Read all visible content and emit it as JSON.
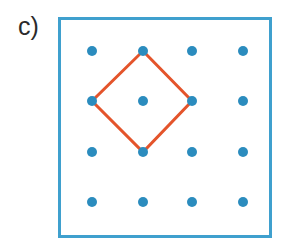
{
  "figure": {
    "panel_label": "c)",
    "label_color": "#2b2b2b",
    "background_color": "#ffffff",
    "width": 290,
    "height": 248
  },
  "board": {
    "name": "geoboard",
    "frame_color": "#3fa0ce",
    "frame_stroke_width": 3,
    "frame_fill": "#ffffff",
    "x": 58,
    "y": 17,
    "width": 214,
    "height": 221
  },
  "grid": {
    "rows": 4,
    "cols": 4,
    "dot_color": "#2b8cbe",
    "dot_radius": 5,
    "x_positions": [
      92,
      143,
      192,
      243
    ],
    "y_positions": [
      51,
      101,
      152,
      202
    ],
    "points": [
      {
        "row": 0,
        "col": 0,
        "cx": 92,
        "cy": 51
      },
      {
        "row": 0,
        "col": 1,
        "cx": 143,
        "cy": 51
      },
      {
        "row": 0,
        "col": 2,
        "cx": 192,
        "cy": 51
      },
      {
        "row": 0,
        "col": 3,
        "cx": 243,
        "cy": 51
      },
      {
        "row": 1,
        "col": 0,
        "cx": 92,
        "cy": 101
      },
      {
        "row": 1,
        "col": 1,
        "cx": 143,
        "cy": 101
      },
      {
        "row": 1,
        "col": 2,
        "cx": 192,
        "cy": 101
      },
      {
        "row": 1,
        "col": 3,
        "cx": 243,
        "cy": 101
      },
      {
        "row": 2,
        "col": 0,
        "cx": 92,
        "cy": 152
      },
      {
        "row": 2,
        "col": 1,
        "cx": 143,
        "cy": 152
      },
      {
        "row": 2,
        "col": 2,
        "cx": 192,
        "cy": 152
      },
      {
        "row": 2,
        "col": 3,
        "cx": 243,
        "cy": 152
      },
      {
        "row": 3,
        "col": 0,
        "cx": 92,
        "cy": 202
      },
      {
        "row": 3,
        "col": 1,
        "cx": 143,
        "cy": 202
      },
      {
        "row": 3,
        "col": 2,
        "cx": 192,
        "cy": 202
      },
      {
        "row": 3,
        "col": 3,
        "cx": 243,
        "cy": 202
      }
    ]
  },
  "shape": {
    "name": "rubber-band-square-rotated",
    "stroke_color": "#e4542b",
    "stroke_width": 3,
    "fill": "none",
    "closed": true,
    "vertices": [
      {
        "cx": 143,
        "cy": 51
      },
      {
        "cx": 192,
        "cy": 101
      },
      {
        "cx": 143,
        "cy": 152
      },
      {
        "cx": 92,
        "cy": 101
      }
    ],
    "path": "M 143 51 L 192 101 L 143 152 L 92 101 Z"
  }
}
